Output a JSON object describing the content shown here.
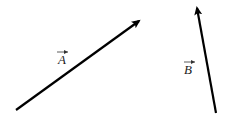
{
  "diagram": {
    "type": "vector-diagram",
    "background": "#ffffff",
    "stroke_color": "#000000",
    "vectors": [
      {
        "name": "A",
        "label": "A",
        "has_overarrow": true,
        "start": [
          16,
          110
        ],
        "end": [
          139,
          21
        ],
        "label_pos": [
          58,
          62
        ]
      },
      {
        "name": "B",
        "label": "B",
        "has_overarrow": true,
        "start": [
          216,
          113
        ],
        "end": [
          197,
          8
        ],
        "label_pos": [
          184,
          72
        ]
      }
    ]
  }
}
